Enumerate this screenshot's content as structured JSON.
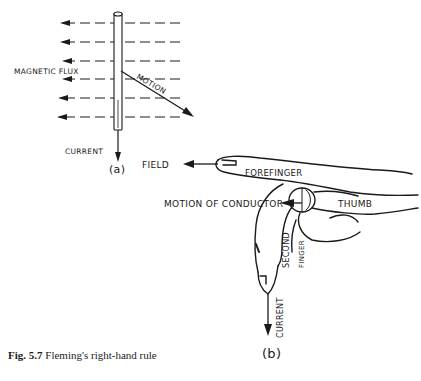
{
  "figure": {
    "caption_label": "Fig. 5.7",
    "caption_text": "Fleming's right-hand rule"
  },
  "panel_a": {
    "label": "(a)",
    "magnetic_flux_label": "MAGNETIC FLUX",
    "motion_label": "MOTION",
    "current_label": "CURRENT",
    "flux_line_count": 6
  },
  "panel_b": {
    "label": "(b)",
    "field_label": "FIELD",
    "forefinger_label": "FOREFINGER",
    "motion_of_conductor_label": "MOTION OF CONDUCTOR",
    "thumb_label": "THUMB",
    "second_label": "SECOND",
    "finger_label": "FINGER",
    "current_label": "CURRENT"
  },
  "colors": {
    "ink": "#1a1a1a",
    "background": "#ffffff"
  }
}
